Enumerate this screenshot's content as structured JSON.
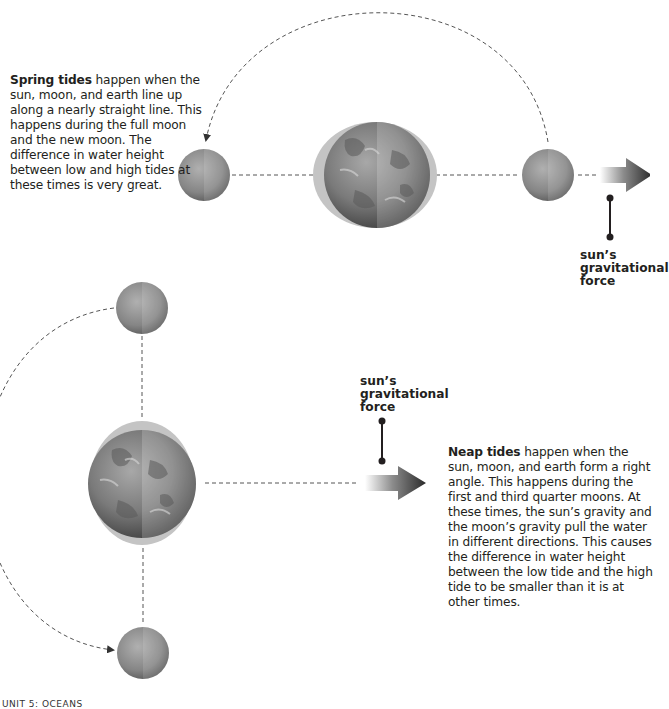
{
  "spring_tides": {
    "heading": "Spring tides",
    "body": " happen when the sun, moon, and earth line up along a nearly straight line. This happens during the full moon and the new moon. The difference in water height between low and high tides at these times is very great.",
    "force_label_line1": "sun’s",
    "force_label_line2": "gravitational",
    "force_label_line3": "force"
  },
  "neap_tides": {
    "heading": "Neap tides",
    "body": " happen when the sun, moon, and earth form a right angle. This happens during the first and third quarter moons. At these times, the sun’s gravity and the moon’s gravity pull the water in different directions. This causes the difference in water height between the low tide and the high tide to be smaller than it is at other times.",
    "force_label_line1": "sun’s",
    "force_label_line2": "gravitational",
    "force_label_line3": "force"
  },
  "footer": {
    "text": "UNIT 5: OCEANS"
  },
  "icons": {
    "earth": "earth-icon",
    "moon": "moon-icon",
    "sun_force_arrow": "arrow-right-icon",
    "orbit_path": "dashed-orbit-arc"
  },
  "colors": {
    "tidal_bulge": "#c4c4c4",
    "earth_dark": "#4a4a4a",
    "earth_light": "#9a9a9a",
    "moon": "#8a8a8a",
    "arrow_dark": "#2e2e2e",
    "text": "#231f20"
  }
}
